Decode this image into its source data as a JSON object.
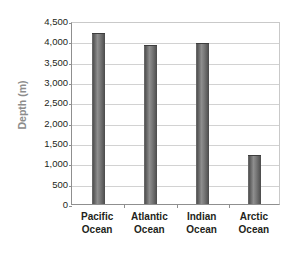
{
  "chart_data": {
    "type": "bar",
    "title": "",
    "xlabel": "",
    "ylabel": "Depth (m)",
    "categories": [
      "Pacific Ocean",
      "Atlantic Ocean",
      "Indian Ocean",
      "Arctic Ocean"
    ],
    "category_lines": [
      [
        "Pacific",
        "Ocean"
      ],
      [
        "Atlantic",
        "Ocean"
      ],
      [
        "Indian",
        "Ocean"
      ],
      [
        "Arctic",
        "Ocean"
      ]
    ],
    "values": [
      4200,
      3900,
      3950,
      1200
    ],
    "ylim": [
      0,
      4500
    ],
    "ytick_step": 500,
    "ytick_labels": [
      "4,500",
      "4,000",
      "3,500",
      "3,000",
      "2,500",
      "2,000",
      "1,500",
      "1,000",
      "500",
      "0"
    ],
    "ytick_values": [
      4500,
      4000,
      3500,
      3000,
      2500,
      2000,
      1500,
      1000,
      500,
      0
    ],
    "grid": true,
    "legend": false,
    "colors": {
      "bar_dark": "#4a4a4a",
      "bar_light": "#8e8e8e",
      "gridline": "#d2d2d2",
      "axis_line": "#8f8f8f",
      "plot_border": "#c9c9c9",
      "tick_text": "#231f20",
      "axis_title_text": "#8c8c8c",
      "background": "#ffffff"
    }
  }
}
